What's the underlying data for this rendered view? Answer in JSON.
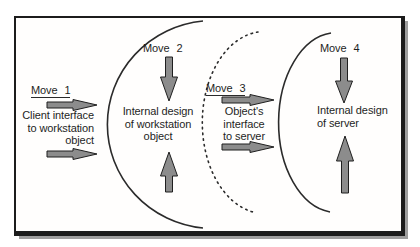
{
  "colors": {
    "arrow_fill": "#8c8c8c",
    "arrow_stroke": "#1f1f1f",
    "arc_color": "#2b2b2b",
    "frame_border": "#1c1c1c"
  },
  "moves": [
    {
      "label": "Move 1",
      "underlined": true,
      "lines": [
        "Client interface",
        "to workstation",
        "object"
      ]
    },
    {
      "label": "Move 2",
      "underlined": false,
      "lines": [
        "Internal design",
        "of workstation",
        "object"
      ]
    },
    {
      "label": "Move 3",
      "underlined": true,
      "lines": [
        "Object's",
        "interface",
        "to server"
      ]
    },
    {
      "label": "Move 4",
      "underlined": false,
      "lines": [
        "Internal design",
        "of server"
      ]
    }
  ],
  "arrows": [
    {
      "name": "move1-interface-arrow",
      "direction": "right"
    },
    {
      "name": "move1-object-arrow",
      "direction": "right"
    },
    {
      "name": "move2-down-arrow",
      "direction": "down"
    },
    {
      "name": "workstation-internal-up-arrow",
      "direction": "up"
    },
    {
      "name": "move3-interface-arrow",
      "direction": "right"
    },
    {
      "name": "move3-server-arrow",
      "direction": "right"
    },
    {
      "name": "move4-down-arrow",
      "direction": "down"
    },
    {
      "name": "server-internal-up-arrow",
      "direction": "up"
    }
  ],
  "boundaries": [
    {
      "name": "workstation-object-boundary-arc",
      "style": "solid"
    },
    {
      "name": "object-server-interface-boundary-arc",
      "style": "dashed"
    },
    {
      "name": "server-boundary-arc",
      "style": "solid"
    }
  ]
}
